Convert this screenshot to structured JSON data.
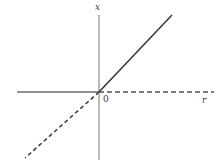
{
  "figure": {
    "title": "",
    "background_color": "#ffffff",
    "stroke_color": "#555555",
    "text_color": "#3a3a3a",
    "labels": {
      "vertical_axis": "x",
      "horizontal_axis": "r",
      "origin": "0"
    }
  },
  "chart_data": {
    "type": "line",
    "title": "",
    "xlabel": "r",
    "ylabel": "x",
    "grid": false,
    "legend": null,
    "origin_label": "0",
    "axes": {
      "vertical": {
        "label": "x",
        "x_pixel": 99,
        "y_top_pixel": 15,
        "y_bottom_pixel": 160,
        "style": "solid",
        "color": "#808080"
      },
      "horizontal": {
        "label": "r",
        "y_pixel": 92,
        "x_left_pixel": 17,
        "x_right_pixel": 214,
        "origin_x_pixel": 99
      }
    },
    "series": [
      {
        "name": "horizontal-ray-left",
        "style": "solid",
        "color": "#6e6e6e",
        "x": [
          17,
          99
        ],
        "y": [
          92,
          92
        ],
        "description": "solid horizontal ray from left edge to origin"
      },
      {
        "name": "horizontal-ray-right",
        "style": "dashed",
        "color": "#555555",
        "x": [
          99,
          214
        ],
        "y": [
          92,
          92
        ],
        "description": "dashed horizontal ray from origin to right edge"
      },
      {
        "name": "diagonal-ray-upper-right",
        "style": "solid",
        "color": "#3a3a3a",
        "x": [
          99,
          172
        ],
        "y": [
          92,
          15
        ],
        "description": "solid diagonal ray rising from origin to upper right"
      },
      {
        "name": "diagonal-ray-lower-left",
        "style": "dashed",
        "color": "#3a3a3a",
        "x": [
          99,
          25
        ],
        "y": [
          92,
          158
        ],
        "description": "dashed diagonal ray descending from origin to lower left"
      }
    ],
    "xlim": [
      17,
      214
    ],
    "ylim": [
      15,
      160
    ]
  }
}
